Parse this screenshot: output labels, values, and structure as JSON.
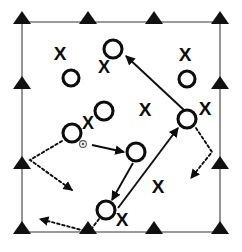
{
  "diagram": {
    "type": "sports-play-diagram",
    "background_color": "#ffffff",
    "ink_color": "#0d0d0d",
    "field_line_color": "#7a7a7a",
    "legend": {
      "offense_symbol": "O",
      "defense_symbol": "X",
      "cone_symbol": "triangle",
      "pass_line_style": "solid",
      "cut_line_style": "dotted",
      "disc_symbol": "small-dot"
    },
    "field": {
      "name": "field-boundary",
      "left": 22,
      "top": 22,
      "right": 220,
      "bottom": 232
    },
    "cones": [
      {
        "name": "cone-top-left",
        "x": 22,
        "y": 22
      },
      {
        "name": "cone-top-mid-left",
        "x": 88,
        "y": 22
      },
      {
        "name": "cone-top-mid-right",
        "x": 154,
        "y": 22
      },
      {
        "name": "cone-top-right",
        "x": 220,
        "y": 22
      },
      {
        "name": "cone-left-upper",
        "x": 22,
        "y": 87
      },
      {
        "name": "cone-left-lower",
        "x": 22,
        "y": 167
      },
      {
        "name": "cone-bottom-left",
        "x": 22,
        "y": 232
      },
      {
        "name": "cone-bottom-mid-left",
        "x": 88,
        "y": 232
      },
      {
        "name": "cone-bottom-mid-right",
        "x": 154,
        "y": 232
      },
      {
        "name": "cone-bottom-right",
        "x": 220,
        "y": 232
      },
      {
        "name": "cone-right-upper",
        "x": 220,
        "y": 87
      },
      {
        "name": "cone-right-lower",
        "x": 220,
        "y": 167
      }
    ],
    "offense_players": [
      {
        "name": "player-o-1",
        "label": "O",
        "x": 113,
        "y": 49,
        "r": 9
      },
      {
        "name": "player-o-2",
        "label": "O",
        "x": 71,
        "y": 78,
        "r": 8
      },
      {
        "name": "player-o-3",
        "label": "O",
        "x": 187,
        "y": 79,
        "r": 8
      },
      {
        "name": "player-o-4",
        "label": "O",
        "x": 104,
        "y": 111,
        "r": 9
      },
      {
        "name": "player-o-5",
        "label": "O",
        "x": 187,
        "y": 119,
        "r": 9
      },
      {
        "name": "player-o-6",
        "label": "O",
        "x": 72,
        "y": 133,
        "r": 9
      },
      {
        "name": "player-o-7",
        "label": "O",
        "x": 136,
        "y": 152,
        "r": 9
      },
      {
        "name": "player-o-8",
        "label": "O",
        "x": 106,
        "y": 210,
        "r": 9
      }
    ],
    "defenders": [
      {
        "name": "defender-x-1",
        "label": "X",
        "x": 60,
        "y": 55,
        "size": 19
      },
      {
        "name": "defender-x-2",
        "label": "X",
        "x": 104,
        "y": 68,
        "size": 18
      },
      {
        "name": "defender-x-3",
        "label": "X",
        "x": 185,
        "y": 56,
        "size": 19
      },
      {
        "name": "defender-x-4",
        "label": "X",
        "x": 88,
        "y": 124,
        "size": 18
      },
      {
        "name": "defender-x-5",
        "label": "X",
        "x": 145,
        "y": 111,
        "size": 19
      },
      {
        "name": "defender-x-6",
        "label": "X",
        "x": 205,
        "y": 110,
        "size": 19
      },
      {
        "name": "defender-x-7",
        "label": "X",
        "x": 158,
        "y": 188,
        "size": 19
      },
      {
        "name": "defender-x-8",
        "label": "X",
        "x": 122,
        "y": 221,
        "size": 19
      }
    ],
    "disc": {
      "name": "disc-marker",
      "x": 83,
      "y": 144,
      "r": 3.4
    },
    "pass_arrows": [
      {
        "name": "pass-arrow-thrower-to-cutter",
        "x1": 92,
        "y1": 145,
        "x2": 124,
        "y2": 152
      },
      {
        "name": "pass-arrow-deep-to-top",
        "x1": 185,
        "y1": 111,
        "x2": 126,
        "y2": 56
      },
      {
        "name": "pass-arrow-cutter-to-under",
        "x1": 133,
        "y1": 163,
        "x2": 112,
        "y2": 200
      },
      {
        "name": "pass-arrow-under-to-deep",
        "x1": 118,
        "y1": 208,
        "x2": 178,
        "y2": 128
      }
    ],
    "cut_arrows": [
      {
        "name": "cut-arrow-handler-swing",
        "points": "62,141 30,160 72,190"
      },
      {
        "name": "cut-arrow-deep-clear",
        "points": "196,128 212,152 191,178"
      },
      {
        "name": "cut-arrow-reset-upline",
        "points": "99,219 89,232 40,219"
      }
    ]
  }
}
